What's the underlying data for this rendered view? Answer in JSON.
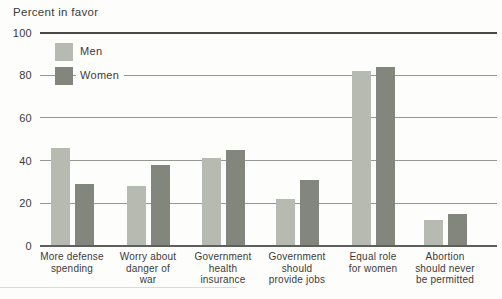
{
  "figure": {
    "title": "Percent in favor"
  },
  "y_axis": {
    "tick_labels": [
      "0",
      "20",
      "40",
      "60",
      "80",
      "100"
    ]
  },
  "legend": {
    "position": "top-left",
    "items": [
      {
        "label": "Men"
      },
      {
        "label": "Women"
      }
    ]
  },
  "chart_data": {
    "type": "bar",
    "title": "Percent in favor",
    "categories": [
      "More defense\nspending",
      "Worry about\ndanger of\nwar",
      "Government\nhealth\ninsurance",
      "Government\nshould\nprovide jobs",
      "Equal role\nfor women",
      "Abortion\nshould never\nbe permitted"
    ],
    "series": [
      {
        "name": "Men",
        "color": "#b6bab1",
        "values": [
          46,
          28,
          41,
          22,
          82,
          12
        ]
      },
      {
        "name": "Women",
        "color": "#82867d",
        "values": [
          29,
          38,
          45,
          31,
          84,
          15
        ]
      }
    ],
    "xlabel": "",
    "ylabel": "Percent in favor",
    "ylim": [
      0,
      100
    ],
    "yticks": [
      0,
      20,
      40,
      60,
      80,
      100
    ],
    "grid": true,
    "grid_color": "#949894",
    "legend_position": "top-left",
    "bar_colors": {
      "men": "#b6bab1",
      "women": "#82867d"
    }
  }
}
